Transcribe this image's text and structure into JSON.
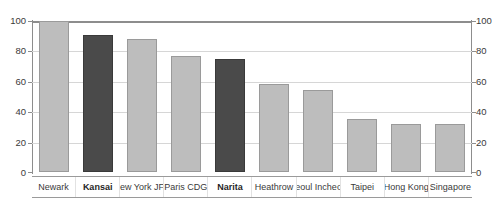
{
  "chart_data": {
    "type": "bar",
    "title": "",
    "subtitle": "",
    "xlabel": "",
    "ylabel": "",
    "ylim": [
      0,
      100
    ],
    "yticks": [
      0,
      20,
      40,
      60,
      80,
      100
    ],
    "grid": true,
    "legend": "none",
    "dual_axis": true,
    "right_axis": {
      "ylim": [
        0,
        100
      ],
      "yticks": [
        0,
        20,
        40,
        60,
        80,
        100
      ]
    },
    "categories": [
      "Newark",
      "Kansai",
      "New York JFK",
      "Paris CDG",
      "Narita",
      "Heathrow",
      "Seoul Incheon",
      "Taipei",
      "Hong Kong",
      "Singapore"
    ],
    "values": [
      100,
      91,
      88,
      77,
      75,
      58,
      54,
      35,
      32,
      32
    ],
    "series": [
      {
        "name": "Index",
        "values": [
          100,
          91,
          88,
          77,
          75,
          58,
          54,
          35,
          32,
          32
        ]
      }
    ],
    "bar_styles": [
      "light",
      "dark",
      "light",
      "light",
      "dark",
      "light",
      "light",
      "light",
      "light",
      "light"
    ],
    "emphasized": [
      "Kansai",
      "Narita"
    ],
    "colors": {
      "bar_light": "#bdbdbd",
      "bar_light_border": "#9a9a9a",
      "bar_dark": "#4a4a4a",
      "bar_dark_border": "#3a3a3a",
      "gridline": "#d6d6d6",
      "axis": "#8d8d8d",
      "text": "#3a3a3a"
    }
  }
}
